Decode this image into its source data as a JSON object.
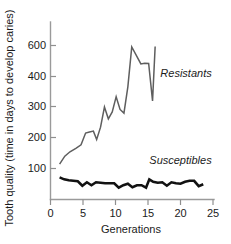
{
  "chart_data": {
    "type": "line",
    "title": "",
    "xlabel": "Generations",
    "ylabel": "Tooth quality (time in days to develop caries)",
    "xlim": [
      0,
      25
    ],
    "ylim": [
      0,
      650
    ],
    "xticks": [
      0,
      5,
      10,
      15,
      20,
      25
    ],
    "xtick_labels": [
      "0",
      "5",
      "10",
      "15",
      "20",
      "25"
    ],
    "yticks": [
      100,
      200,
      300,
      400,
      600
    ],
    "ytick_labels": [
      "100",
      "200",
      "300",
      "400",
      "600"
    ],
    "grid": false,
    "legend_position": "inline-annotation",
    "series": [
      {
        "name": "Resistants",
        "color": "#5e5e5e",
        "x": [
          1.4,
          2.2,
          3.0,
          3.9,
          4.7,
          5.4,
          6.0,
          6.6,
          7.1,
          7.7,
          8.3,
          8.9,
          9.5,
          10.1,
          10.7,
          11.3,
          11.9,
          12.5,
          13.2,
          13.9,
          14.5,
          15.1,
          15.7,
          16.1
        ],
        "y": [
          118,
          150,
          168,
          182,
          196,
          244,
          248,
          252,
          218,
          268,
          350,
          302,
          330,
          392,
          340,
          325,
          432,
          594,
          560,
          525,
          528,
          527,
          375,
          596
        ]
      },
      {
        "name": "Susceptibles",
        "color": "#121212",
        "x": [
          1.4,
          2.1,
          2.8,
          3.5,
          4.2,
          4.9,
          5.6,
          6.3,
          7.0,
          7.7,
          8.4,
          9.1,
          9.8,
          10.5,
          11.2,
          11.9,
          12.6,
          13.3,
          14.0,
          14.7,
          15.2,
          15.8,
          16.5,
          17.2,
          17.9,
          18.6,
          19.3,
          20.0,
          20.7,
          21.4,
          22.1,
          22.8,
          23.5
        ],
        "y": [
          64,
          56,
          52,
          50,
          48,
          30,
          44,
          32,
          44,
          42,
          40,
          40,
          40,
          22,
          32,
          38,
          24,
          32,
          32,
          22,
          56,
          46,
          42,
          44,
          30,
          44,
          40,
          38,
          46,
          50,
          50,
          28,
          36
        ]
      }
    ],
    "annotations": [
      {
        "text": "Resistants",
        "x": 16.9,
        "y": 470
      },
      {
        "text": "Susceptibles",
        "x": 15.2,
        "y": 118
      }
    ]
  }
}
